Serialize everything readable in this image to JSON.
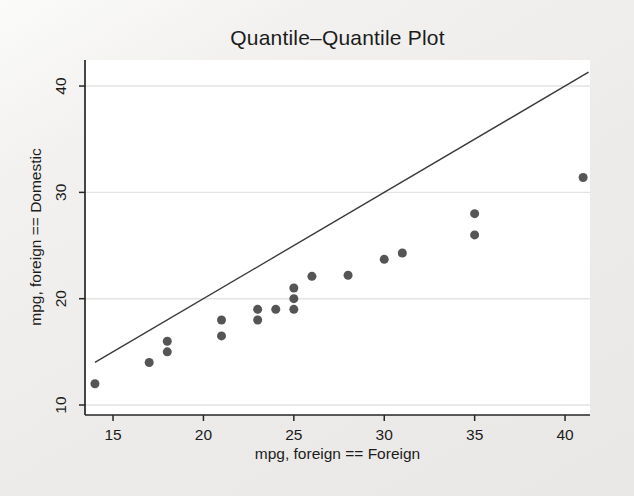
{
  "chart_data": {
    "type": "scatter",
    "title": "Quantile–Quantile Plot",
    "xlabel": "mpg, foreign == Foreign",
    "ylabel": "mpg, foreign == Domestic",
    "x_ticks": [
      15,
      20,
      25,
      30,
      35,
      40
    ],
    "y_ticks": [
      10,
      20,
      30,
      40
    ],
    "xlim": [
      13.45,
      41.38
    ],
    "ylim": [
      9.06,
      42.45
    ],
    "grid": "horizontal-only",
    "legend": "none",
    "points": [
      [
        14,
        12
      ],
      [
        17,
        14
      ],
      [
        18,
        15
      ],
      [
        18,
        16
      ],
      [
        21,
        16.5
      ],
      [
        21,
        18
      ],
      [
        23,
        18
      ],
      [
        23,
        19
      ],
      [
        24,
        19
      ],
      [
        25,
        19
      ],
      [
        25,
        20
      ],
      [
        25,
        21
      ],
      [
        26,
        22.1
      ],
      [
        28,
        22.2
      ],
      [
        30,
        23.7
      ],
      [
        31,
        24.3
      ],
      [
        35,
        26
      ],
      [
        35,
        28
      ],
      [
        41,
        31.4
      ]
    ],
    "reference_line": {
      "from": [
        14,
        14
      ],
      "to": [
        41.3,
        41.3
      ],
      "meaning": "y = x identity line"
    },
    "marker": {
      "shape": "circle",
      "size_px": 9
    },
    "colors": {
      "point": "#474747",
      "reference_line": "#3a3a3a",
      "axis": "#262626",
      "grid": "#e4e3e1",
      "plot_background": "#ffffff",
      "figure_background": "#ecebe9",
      "text": "#1c1c1c"
    }
  }
}
